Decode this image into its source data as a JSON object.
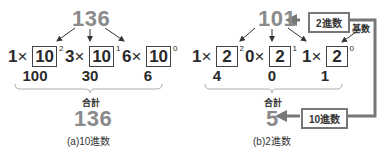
{
  "panel_a": {
    "number": "136",
    "terms": [
      {
        "coef": "1",
        "times": "×",
        "base": "10",
        "exp": "2",
        "value": "100"
      },
      {
        "coef": "3",
        "times": "×",
        "base": "10",
        "exp": "1",
        "value": "30"
      },
      {
        "coef": "6",
        "times": "×",
        "base": "10",
        "exp": "0",
        "value": "6"
      }
    ],
    "sum_label": "合計",
    "result": "136",
    "caption": "(a)10進数"
  },
  "panel_b": {
    "number": "101",
    "terms": [
      {
        "coef": "1",
        "times": "×",
        "base": "2",
        "exp": "2",
        "value": "4"
      },
      {
        "coef": "0",
        "times": "×",
        "base": "2",
        "exp": "1",
        "value": "0"
      },
      {
        "coef": "1",
        "times": "×",
        "base": "2",
        "exp": "0",
        "value": "1"
      }
    ],
    "sum_label": "合計",
    "result": "5",
    "caption": "(b)2進数",
    "tag_top": "2進数",
    "tag_bottom": "10進数",
    "base_label": "基数"
  },
  "colors": {
    "number_gray": "#8a8a8a",
    "arrow_gray": "#777777",
    "text": "#2a2a2a"
  }
}
